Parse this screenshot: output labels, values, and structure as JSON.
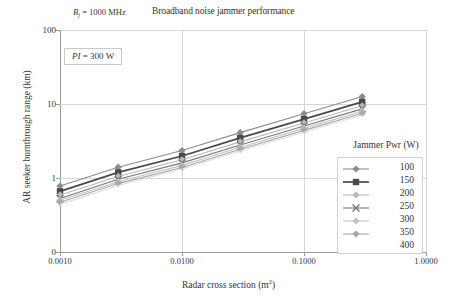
{
  "chart_data": {
    "type": "line",
    "title": "Broadband noise jammer performance",
    "xlabel": "Radar cross section (m²)",
    "ylabel": "AR seeker burnthrough range (km)",
    "xscale": "log",
    "yscale": "log",
    "xlim": [
      0.001,
      1.0
    ],
    "ylim": [
      0.1,
      100
    ],
    "x_tick_labels": [
      "0.0010",
      "0.0100",
      "0.1000",
      "1.0000"
    ],
    "x_tick_values": [
      0.001,
      0.01,
      0.1,
      1.0
    ],
    "y_tick_labels": [
      "100",
      "10",
      "1",
      "0"
    ],
    "y_tick_values": [
      100,
      10,
      1,
      0.1
    ],
    "grid": true,
    "legend_position": "right",
    "legend_title": "Jammer Pwr (W)",
    "annotations": [
      {
        "text": "Bj = 1000 MHz",
        "position": "above-plot-left"
      },
      {
        "text": "PI = 300 W",
        "position": "inside-top-left",
        "boxed": true
      }
    ],
    "x": [
      0.001,
      0.003,
      0.01,
      0.03,
      0.1,
      0.3
    ],
    "series": [
      {
        "name": "100",
        "marker": "diamond",
        "color": "#8c8c8c",
        "values": [
          0.78,
          1.4,
          2.35,
          4.1,
          7.4,
          12.6
        ]
      },
      {
        "name": "150",
        "marker": "square",
        "color": "#4a4a4a",
        "values": [
          0.66,
          1.19,
          1.98,
          3.48,
          6.25,
          10.7
        ]
      },
      {
        "name": "200",
        "marker": "diamond-light",
        "color": "#b8b8b8",
        "values": [
          0.59,
          1.05,
          1.76,
          3.08,
          5.55,
          9.45
        ]
      },
      {
        "name": "250",
        "marker": "cross",
        "color": "#777777",
        "values": [
          0.53,
          0.96,
          1.6,
          2.8,
          5.05,
          8.6
        ]
      },
      {
        "name": "300",
        "marker": "diamond-light",
        "color": "#c2c2c2",
        "values": [
          0.5,
          0.89,
          1.48,
          2.6,
          4.68,
          7.98
        ]
      },
      {
        "name": "350",
        "marker": "diamond-mid",
        "color": "#a8a8a8",
        "values": [
          0.47,
          0.84,
          1.39,
          2.44,
          4.4,
          7.5
        ]
      },
      {
        "name": "400",
        "marker": "none",
        "color": "#dddddd",
        "values": [
          0.44,
          0.79,
          1.32,
          2.31,
          4.16,
          7.1
        ]
      }
    ]
  },
  "chart": {
    "title": "Broadband noise jammer performance",
    "bj_label_prefix": "B",
    "bj_label_sub": "j",
    "bj_label_rest": " = 1000 MHz",
    "pi_label_italic": "PI",
    "pi_label_rest": " = 300 W",
    "xlabel_main": "Radar cross section (m",
    "xlabel_sup": "2",
    "xlabel_tail": ")",
    "ylabel": "AR seeker burnthrough range (km)"
  },
  "legend": {
    "title": "Jammer Pwr (W)",
    "items": [
      {
        "label": "100",
        "marker": "diamond-icon"
      },
      {
        "label": "150",
        "marker": "square-icon"
      },
      {
        "label": "200",
        "marker": "diamond-light-icon"
      },
      {
        "label": "250",
        "marker": "cross-icon"
      },
      {
        "label": "300",
        "marker": "diamond-light-icon"
      },
      {
        "label": "350",
        "marker": "diamond-mid-icon"
      },
      {
        "label": "400",
        "marker": "none-icon"
      }
    ]
  },
  "axes": {
    "x_ticks": [
      "0.0010",
      "0.0100",
      "0.1000",
      "1.0000"
    ],
    "y_ticks": [
      "100",
      "10",
      "1",
      "0"
    ]
  },
  "colors": {
    "grid": "#d6d6d6",
    "axis": "#9a9a9a",
    "text": "#333333",
    "series_dark": "#4a4a4a",
    "series_mid": "#8c8c8c",
    "series_light": "#c2c2c2"
  }
}
